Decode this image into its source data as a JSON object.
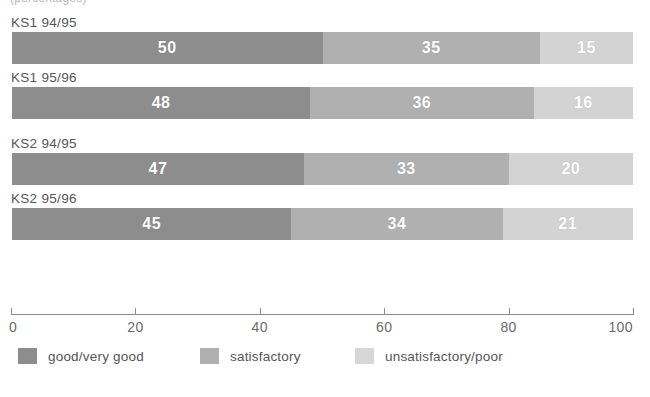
{
  "clipped_header_text": "(percentages)",
  "chart_data": {
    "type": "bar",
    "orientation": "horizontal",
    "stacked": true,
    "stack_total": 100,
    "title": "",
    "subtitle": "",
    "xlabel": "",
    "ylabel": "",
    "xlim": [
      0,
      100
    ],
    "grid": false,
    "legend_position": "bottom",
    "categories": [
      "KS1 94/95",
      "KS1 95/96",
      "KS2 94/95",
      "KS2 95/96"
    ],
    "series": [
      {
        "name": "good/very good",
        "color": "#8d8d8d",
        "values": [
          50,
          48,
          47,
          45
        ]
      },
      {
        "name": "satisfactory",
        "color": "#b0b0b0",
        "values": [
          35,
          36,
          33,
          34
        ]
      },
      {
        "name": "unsatisfactory/poor",
        "color": "#d3d3d3",
        "values": [
          15,
          16,
          20,
          21
        ]
      }
    ],
    "xticks": [
      0,
      20,
      40,
      60,
      80,
      100
    ],
    "xtick_labels": [
      "0",
      "20",
      "40",
      "60",
      "80",
      "100"
    ],
    "group_breaks_after": [
      "KS1 95/96"
    ],
    "rows": [
      {
        "label": "KS1 94/95",
        "segments": [
          {
            "series": "good/very good",
            "value": 50,
            "display": "50"
          },
          {
            "series": "satisfactory",
            "value": 35,
            "display": "35"
          },
          {
            "series": "unsatisfactory/poor",
            "value": 15,
            "display": "15"
          }
        ]
      },
      {
        "label": "KS1 95/96",
        "segments": [
          {
            "series": "good/very good",
            "value": 48,
            "display": "48"
          },
          {
            "series": "satisfactory",
            "value": 36,
            "display": "36"
          },
          {
            "series": "unsatisfactory/poor",
            "value": 16,
            "display": "16"
          }
        ]
      },
      {
        "label": "KS2 94/95",
        "segments": [
          {
            "series": "good/very good",
            "value": 47,
            "display": "47"
          },
          {
            "series": "satisfactory",
            "value": 33,
            "display": "33"
          },
          {
            "series": "unsatisfactory/poor",
            "value": 20,
            "display": "20"
          }
        ]
      },
      {
        "label": "KS2 95/96",
        "segments": [
          {
            "series": "good/very good",
            "value": 45,
            "display": "45"
          },
          {
            "series": "satisfactory",
            "value": 34,
            "display": "34"
          },
          {
            "series": "unsatisfactory/poor",
            "value": 21,
            "display": "21"
          }
        ]
      }
    ]
  },
  "colors": {
    "good": "#8d8d8d",
    "satisfactory": "#b0b0b0",
    "unsatisfactory": "#d3d3d3",
    "axis": "#8b8b8b",
    "text": "#55555a",
    "value_text": "#ffffff",
    "background": "#ffffff"
  }
}
